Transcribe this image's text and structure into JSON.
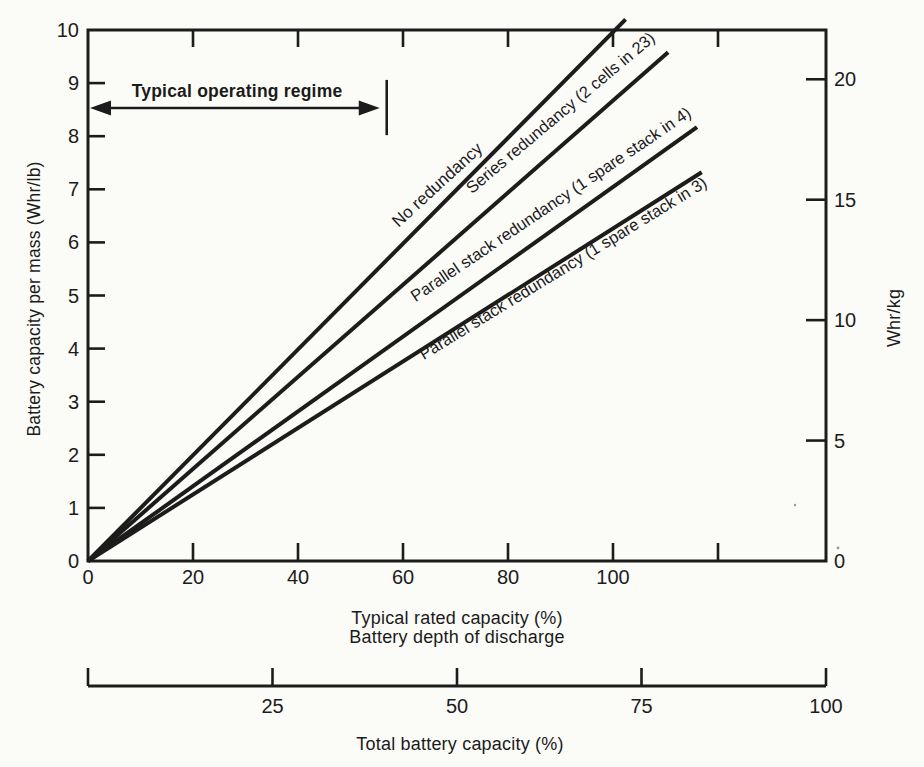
{
  "figure": {
    "paper_color": "#fbfbf8",
    "ink_color": "#1c1c1c"
  },
  "chart_data": {
    "type": "line",
    "title": "",
    "y_axis_left": {
      "label": "Battery capacity per mass (Whr/lb)",
      "range": [
        0,
        10
      ],
      "tick_label_values": [
        0,
        1,
        2,
        3,
        4,
        5,
        6,
        7,
        8,
        9,
        10
      ],
      "inner_tick_values": [
        1,
        2,
        3,
        4,
        5,
        6,
        7,
        8,
        9
      ],
      "grid": false
    },
    "y_axis_right": {
      "label": "Whr/kg",
      "range": [
        0,
        22.4
      ],
      "tick_label_values": [
        0,
        5,
        10,
        15,
        20
      ],
      "inner_tick_values": [
        5,
        10,
        15,
        20
      ],
      "whr_per_kg_per_whr_per_lb": 2.2046
    },
    "x_axis": {
      "label_line1": "Typical rated capacity (%)",
      "label_line2": "Battery depth of discharge",
      "range": [
        0,
        140.6
      ],
      "tick_values": [
        20,
        40,
        60,
        80,
        100,
        120
      ],
      "labeled_tick_values": [
        0,
        20,
        40,
        60,
        80,
        100
      ],
      "top_edge_ticks": true
    },
    "x_axis_secondary": {
      "label": "Total battery capacity (%)",
      "range": [
        0,
        100
      ],
      "tick_values": [
        0,
        25,
        50,
        75,
        100
      ],
      "labeled_tick_values": [
        25,
        50,
        75,
        100
      ]
    },
    "series": [
      {
        "name": "No redundancy",
        "points": [
          [
            0,
            0
          ],
          [
            102.4,
            10.2
          ]
        ]
      },
      {
        "name": "Series redundancy (2 cells in 23)",
        "points": [
          [
            0,
            0
          ],
          [
            110.5,
            9.58
          ]
        ]
      },
      {
        "name": "Parallel stack redundancy (1 spare stack in 4)",
        "points": [
          [
            0,
            0
          ],
          [
            116.0,
            8.17
          ]
        ]
      },
      {
        "name": "Parallel stack redundancy (1 spare stack in 3)",
        "points": [
          [
            0,
            0
          ],
          [
            116.9,
            7.32
          ]
        ]
      }
    ],
    "annotation": {
      "text": "Typical operating regime",
      "arrow_y_whr_lb": 8.53,
      "x_range_pct": [
        0,
        57
      ],
      "end_marker_x_pct": 56.9,
      "end_marker_y_range": [
        8.02,
        9.06
      ]
    }
  }
}
